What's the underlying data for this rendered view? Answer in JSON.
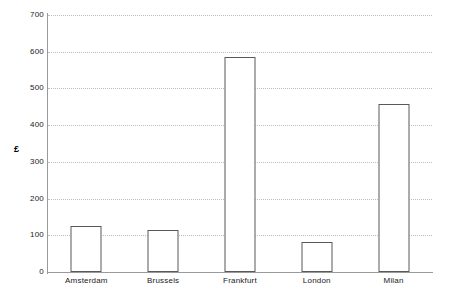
{
  "chart_data": {
    "type": "bar",
    "title": "",
    "subtitle": "",
    "xlabel": "",
    "ylabel": "£",
    "categories": [
      "Amsterdam",
      "Brussels",
      "Frankfurt",
      "London",
      "Milan"
    ],
    "values": [
      125,
      115,
      585,
      82,
      458
    ],
    "series": [
      {
        "name": "",
        "values": [
          125,
          115,
          585,
          82,
          458
        ]
      }
    ],
    "ylim": [
      0,
      700
    ],
    "y_ticks": [
      0,
      100,
      200,
      300,
      400,
      500,
      600,
      700
    ],
    "y_tick_labels": [
      "0",
      "100",
      "200",
      "300",
      "400",
      "500",
      "600",
      "700"
    ],
    "grid": true,
    "grid_axis": "y",
    "grid_style": "dotted",
    "legend": false,
    "legend_position": "none",
    "colors": {
      "bar_fill": "#ffffff",
      "bar_stroke": "#595959",
      "gridline": "#bdbdbd",
      "axis": "#9a9a9a",
      "text": "#1a1a1a",
      "background": "#ffffff"
    }
  },
  "axis": {
    "y_title": "£"
  }
}
